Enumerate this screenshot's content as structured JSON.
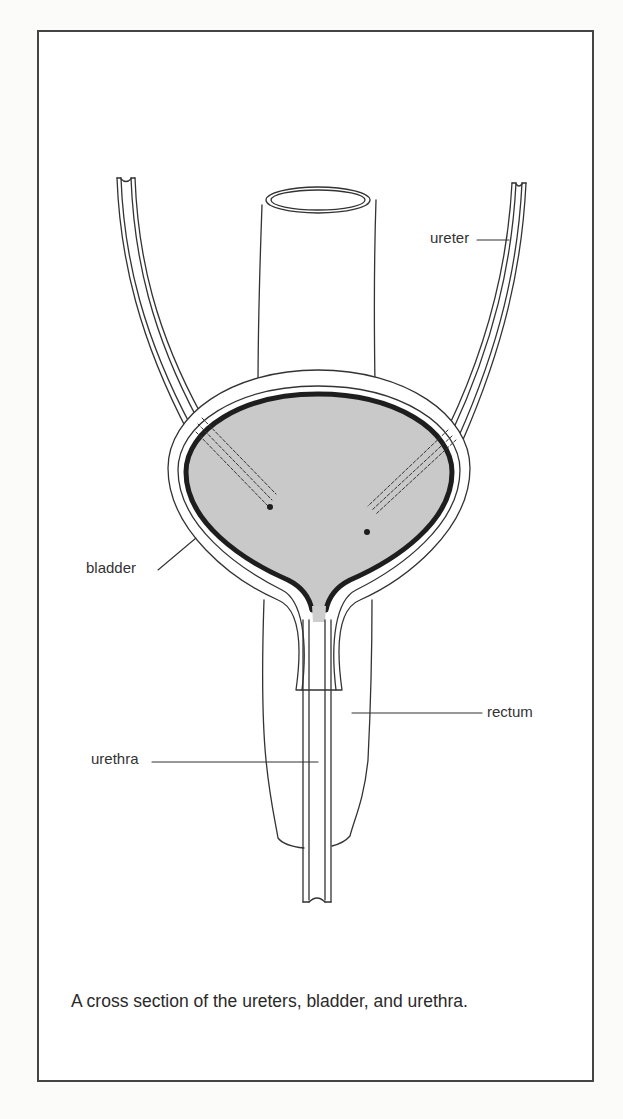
{
  "figure": {
    "caption": "A cross section of the ureters, bladder, and urethra.",
    "labels": {
      "ureter": "ureter",
      "bladder": "bladder",
      "rectum": "rectum",
      "urethra": "urethra"
    },
    "colors": {
      "line": "#333333",
      "bladder_fill": "#c8c8c8",
      "bladder_wall": "#1e1e1e",
      "frame": "#444444"
    }
  }
}
